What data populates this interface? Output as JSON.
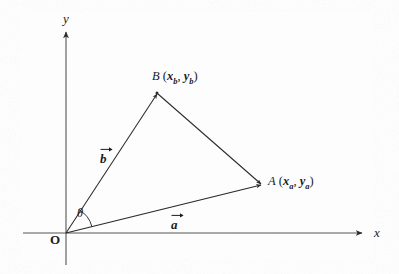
{
  "figure": {
    "width": 399,
    "height": 274,
    "background_color": "#fdfdfd",
    "ink_color": "#2a2a2a"
  },
  "axes": {
    "x_label": "x",
    "y_label": "y",
    "origin_label": "O",
    "x_axis_name": "horizontal-axis",
    "y_axis_name": "vertical-axis"
  },
  "points": {
    "origin": {
      "name": "O",
      "x": 66,
      "y": 233
    },
    "a": {
      "letter": "A",
      "coord_open": " (",
      "coord_x_base": "x",
      "coord_x_sub": "a",
      "coord_sep": ", ",
      "coord_y_base": "y",
      "coord_y_sub": "a",
      "coord_close": ")",
      "full_label": "A (xa, ya)",
      "x": 262,
      "y": 185
    },
    "b": {
      "letter": "B",
      "coord_open": " (",
      "coord_x_base": "x",
      "coord_x_sub": "b",
      "coord_sep": ", ",
      "coord_y_base": "y",
      "coord_y_sub": "b",
      "coord_close": ")",
      "full_label": "B (xb, yb)",
      "x": 157,
      "y": 93
    }
  },
  "vectors": {
    "a": {
      "label": "a",
      "has_overarrow": true,
      "from": "O",
      "to": "A"
    },
    "b": {
      "label": "b",
      "has_overarrow": true,
      "from": "O",
      "to": "B"
    }
  },
  "angle": {
    "label": "θ",
    "between": "a and b",
    "arc_radius": 26
  },
  "segments": {
    "b_to_a": {
      "from": "B",
      "to": "A",
      "style": "solid"
    }
  },
  "icons": {
    "arrowhead": "arrowhead-icon",
    "overarrow": "vector-overarrow-icon"
  }
}
